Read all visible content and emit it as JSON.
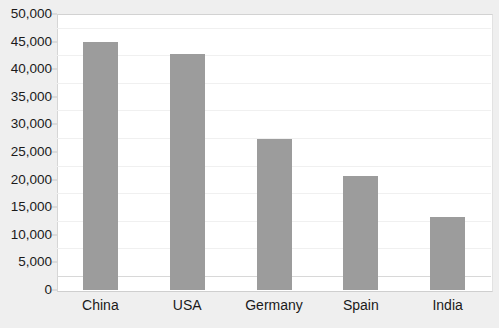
{
  "chart_data": {
    "type": "bar",
    "title": "",
    "subtitle": "",
    "xlabel": "",
    "ylabel": "",
    "categories": [
      "China",
      "USA",
      "Germany",
      "Spain",
      "India"
    ],
    "values": [
      45000,
      42750,
      27350,
      20650,
      13200
    ],
    "series": [
      {
        "name": "",
        "values": [
          45000,
          42750,
          27350,
          20650,
          13200
        ]
      }
    ],
    "ylim": [
      0,
      50000
    ],
    "ytick_values": [
      0,
      5000,
      10000,
      15000,
      20000,
      25000,
      30000,
      35000,
      40000,
      45000,
      50000
    ],
    "ytick_labels": [
      "0",
      "5,000",
      "10,000",
      "15,000",
      "20,000",
      "25,000",
      "30,000",
      "35,000",
      "40,000",
      "45,000",
      "50,000"
    ],
    "grid": true,
    "grid_axis": "y",
    "legend": false,
    "legend_position": "none",
    "annotations": [],
    "bar_color": "#9c9c9c",
    "plot_background": "#ffffff",
    "figure_background": "#efefef",
    "gridline_color": "#f0f0f0",
    "axis_color": "#d2d2d2",
    "text_color": "#1a1a1a"
  }
}
